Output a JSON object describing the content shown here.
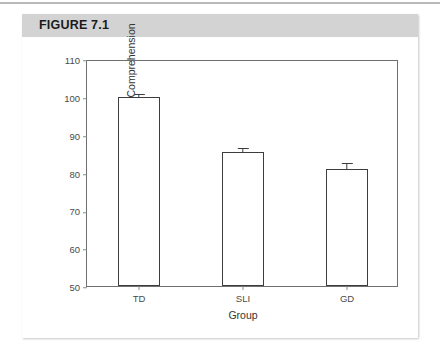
{
  "figure": {
    "header_label": "FIGURE 7.1"
  },
  "chart_data": {
    "type": "bar",
    "title": "",
    "categories": [
      "TD",
      "SLI",
      "GD"
    ],
    "values": [
      100,
      85.3,
      81
    ],
    "errors": [
      0.8,
      1.3,
      1.5
    ],
    "xlabel": "Group",
    "ylabel": "Standard Score for Reading Comprehension",
    "ylim": [
      50,
      110
    ],
    "yticks": [
      50,
      60,
      70,
      80,
      90,
      100,
      110
    ],
    "ytick_labels": [
      "50",
      "60",
      "70",
      "80",
      "90",
      "100",
      "110"
    ],
    "grid": false,
    "legend": false,
    "bar_facecolor": "#ffffff",
    "bar_edgecolor": "#3d3d3d"
  }
}
